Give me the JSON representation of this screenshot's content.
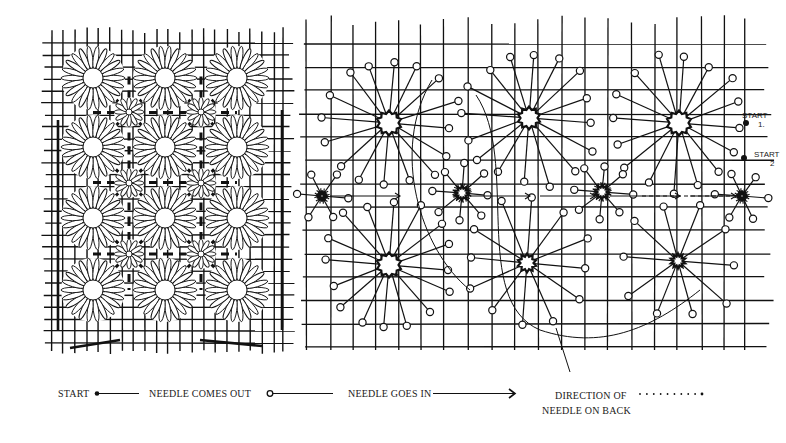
{
  "figure": {
    "width": 786,
    "height": 443,
    "ink_color": "#111111",
    "paper_color": "#ffffff"
  },
  "left_panel": {
    "name": "finished-pattern",
    "grid": {
      "x0": 44,
      "x1": 292,
      "y0": 30,
      "y1": 352,
      "v_lines": [
        52,
        63,
        75,
        87,
        98,
        110,
        122,
        133,
        145,
        157,
        168,
        180,
        192,
        204,
        215,
        227,
        239,
        250,
        262,
        274,
        283
      ],
      "h_lines": [
        43,
        55,
        67,
        79,
        91,
        103,
        115,
        127,
        139,
        151,
        163,
        175,
        187,
        199,
        211,
        223,
        235,
        247,
        259,
        271,
        283,
        295,
        307,
        319,
        331,
        343
      ]
    },
    "flowers": {
      "cols": [
        93,
        165,
        237
      ],
      "rows": [
        78,
        147,
        218,
        290
      ],
      "petal_count": 22,
      "inner_radius": 10,
      "outer_radius": 31
    },
    "small_flowers": {
      "cols": [
        129,
        201
      ],
      "rows": [
        112,
        183,
        254
      ],
      "outer_radius": 14
    }
  },
  "right_panel": {
    "name": "working-diagram",
    "grid": {
      "x0": 302,
      "x1": 770,
      "y0": 20,
      "y1": 350,
      "v_lines": [
        306,
        331,
        353,
        376,
        399,
        421,
        444,
        468,
        492,
        515,
        538,
        562,
        585,
        608,
        632,
        655,
        677,
        702,
        724,
        745
      ],
      "h_lines": [
        44,
        67,
        90,
        114,
        137,
        160,
        184,
        207,
        230,
        254,
        277,
        300,
        324,
        347
      ]
    },
    "large_stars": [
      {
        "cx": 389,
        "cy": 123,
        "r": 10,
        "spokes": 16,
        "length": 70
      },
      {
        "cx": 529,
        "cy": 118,
        "r": 9,
        "spokes": 16,
        "length": 70
      },
      {
        "cx": 679,
        "cy": 123,
        "r": 10,
        "spokes": 16,
        "length": 70
      },
      {
        "cx": 389,
        "cy": 265,
        "r": 10,
        "spokes": 16,
        "length": 68
      },
      {
        "cx": 527,
        "cy": 263,
        "r": 7,
        "spokes": 12,
        "length": 66
      },
      {
        "cx": 678,
        "cy": 261,
        "r": 5,
        "spokes": 10,
        "length": 64
      }
    ],
    "small_stars": [
      {
        "cx": 462,
        "cy": 193,
        "r": 5,
        "spokes": 8,
        "length": 30
      },
      {
        "cx": 602,
        "cy": 192,
        "r": 5,
        "spokes": 8,
        "length": 30
      },
      {
        "cx": 322,
        "cy": 196,
        "r": 3,
        "spokes": 6,
        "length": 26
      },
      {
        "cx": 742,
        "cy": 196,
        "r": 3,
        "spokes": 6,
        "length": 26
      }
    ],
    "start_labels": [
      {
        "text": "START",
        "sub": "1.",
        "x": 738,
        "y": 118,
        "dot_x": 746,
        "dot_y": 123
      },
      {
        "text": "START",
        "sub": "2",
        "x": 750,
        "y": 157,
        "dot_x": 744,
        "dot_y": 158
      }
    ],
    "pointer_line": {
      "x1": 556,
      "y1": 328,
      "x2": 570,
      "y2": 372
    }
  },
  "legend": {
    "y": 397,
    "items": [
      {
        "id": "start",
        "label": "START",
        "x": 58,
        "symbol": "dot-line",
        "sym_x": 97,
        "sym_len": 42
      },
      {
        "id": "needle-out",
        "label": "NEEDLE COMES OUT",
        "x": 149,
        "symbol": "circle-line",
        "sym_x": 267,
        "sym_len": 66
      },
      {
        "id": "needle-in",
        "label": "NEEDLE GOES IN",
        "x": 348,
        "symbol": "arrow-line",
        "sym_x": 433,
        "sym_len": 82
      },
      {
        "id": "direction-back",
        "label": "DIRECTION OF",
        "label2": "NEEDLE ON BACK",
        "x": 555,
        "symbol": "dotted-line",
        "sym_x": 640,
        "sym_len": 62
      }
    ]
  }
}
